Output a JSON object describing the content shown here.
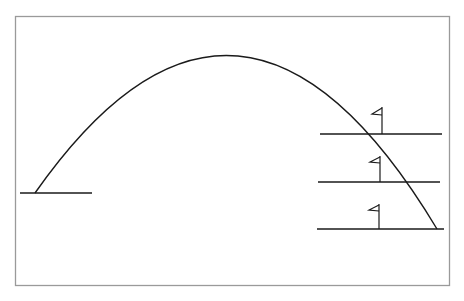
{
  "diagram": {
    "colors": {
      "frame": "#9a9a9a",
      "ink": "#1a1a1a",
      "background": "#ffffff"
    },
    "frame": {
      "x": 15,
      "y": 16,
      "width": 434,
      "height": 269
    },
    "launch_ledge": {
      "x1": 20,
      "x2": 92,
      "y": 193
    },
    "trajectory": {
      "start": [
        35,
        193
      ],
      "peak": [
        240,
        47
      ],
      "end": [
        437,
        229
      ]
    },
    "platforms": [
      {
        "label": "upper",
        "x1": 320,
        "x2": 442,
        "y": 134,
        "flag_x": 382
      },
      {
        "label": "middle",
        "x1": 318,
        "x2": 440,
        "y": 182,
        "flag_x": 380
      },
      {
        "label": "lower",
        "x1": 317,
        "x2": 444,
        "y": 229,
        "flag_x": 379
      }
    ]
  }
}
